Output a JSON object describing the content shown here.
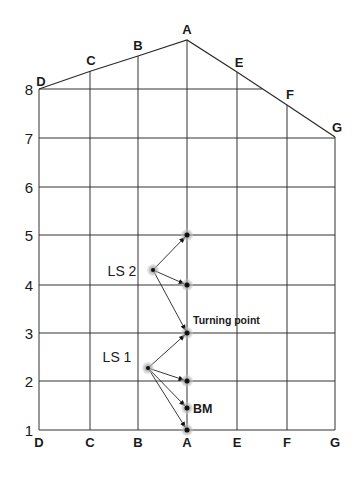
{
  "diagram": {
    "title": "",
    "columns": [
      {
        "label": "D",
        "x": 39
      },
      {
        "label": "C",
        "x": 90
      },
      {
        "label": "B",
        "x": 138
      },
      {
        "label": "A",
        "x": 187
      },
      {
        "label": "E",
        "x": 237
      },
      {
        "label": "F",
        "x": 287
      },
      {
        "label": "G",
        "x": 335
      }
    ],
    "rows": [
      {
        "label": "8",
        "y": 89
      },
      {
        "label": "7",
        "y": 138
      },
      {
        "label": "6",
        "y": 187
      },
      {
        "label": "5",
        "y": 235
      },
      {
        "label": "4",
        "y": 285
      },
      {
        "label": "3",
        "y": 333
      },
      {
        "label": "2",
        "y": 381
      },
      {
        "label": "1",
        "y": 430
      }
    ],
    "top_outline": [
      {
        "label": "D",
        "x": 39,
        "y": 89
      },
      {
        "label": "C",
        "x": 91,
        "y": 71
      },
      {
        "label": "B",
        "x": 138,
        "y": 56
      },
      {
        "label": "A",
        "x": 187,
        "y": 40
      },
      {
        "label": "E",
        "x": 237,
        "y": 72
      },
      {
        "label": "F",
        "x": 287,
        "y": 105
      },
      {
        "label": "G",
        "x": 335,
        "y": 137
      }
    ],
    "stations": [
      {
        "label": "LS 2",
        "x": 153,
        "y": 270,
        "label_x": 122,
        "label_y": 276
      },
      {
        "label": "LS 1",
        "x": 148,
        "y": 368,
        "label_x": 117,
        "label_y": 362
      }
    ],
    "points": [
      {
        "id": "A5",
        "x": 187,
        "y": 235
      },
      {
        "id": "A4",
        "x": 187,
        "y": 285
      },
      {
        "id": "A3",
        "x": 187,
        "y": 333
      },
      {
        "id": "A2",
        "x": 187,
        "y": 381
      },
      {
        "id": "BM",
        "x": 187,
        "y": 408
      },
      {
        "id": "A1",
        "x": 187,
        "y": 430
      }
    ],
    "sightlines": [
      {
        "from": "LS 2",
        "to": "A5"
      },
      {
        "from": "LS 2",
        "to": "A4"
      },
      {
        "from": "LS 2",
        "to": "A3"
      },
      {
        "from": "LS 1",
        "to": "A3"
      },
      {
        "from": "LS 1",
        "to": "A2"
      },
      {
        "from": "LS 1",
        "to": "BM"
      },
      {
        "from": "LS 1",
        "to": "A1"
      }
    ],
    "annotations": {
      "turning_point": "Turning point",
      "bm": "BM"
    },
    "colors": {
      "line": "#2a2a2a",
      "grid": "#333333",
      "halo": "#9a9a9a",
      "dot": "#111111"
    }
  }
}
